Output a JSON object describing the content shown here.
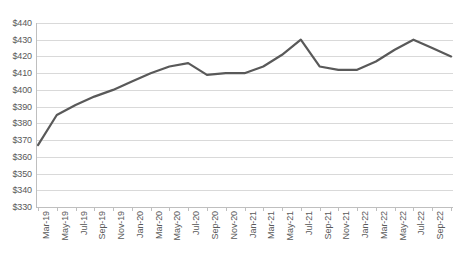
{
  "chart_data": {
    "type": "line",
    "title": "",
    "xlabel": "",
    "ylabel": "",
    "ylim": [
      330,
      440
    ],
    "ytick_step": 10,
    "grid": true,
    "legend": false,
    "line_color": "#595959",
    "gridline_color": "#d9d9d9",
    "axis_color": "#bfbfbf",
    "label_color": "#595959",
    "ytick_labels": [
      "$440",
      "$430",
      "$420",
      "$410",
      "$400",
      "$390",
      "$380",
      "$370",
      "$360",
      "$350",
      "$340",
      "$330"
    ],
    "ytick_values": [
      440,
      430,
      420,
      410,
      400,
      390,
      380,
      370,
      360,
      350,
      340,
      330
    ],
    "categories": [
      "Mar-19",
      "May-19",
      "Jul-19",
      "Sep-19",
      "Nov-19",
      "Jan-20",
      "Mar-20",
      "May-20",
      "Jul-20",
      "Sep-20",
      "Nov-20",
      "Jan-21",
      "Mar-21",
      "May-21",
      "Jul-21",
      "Sep-21",
      "Nov-21",
      "Jan-22",
      "Mar-22",
      "May-22",
      "Jul-22",
      "Sep-22",
      "Nov-22"
    ],
    "series": [
      {
        "name": "Series 1",
        "values": [
          367,
          385,
          391,
          396,
          400,
          405,
          410,
          414,
          416,
          409,
          410,
          410,
          414,
          421,
          430,
          414,
          412,
          412,
          417,
          424,
          430,
          425,
          420
        ]
      }
    ]
  }
}
